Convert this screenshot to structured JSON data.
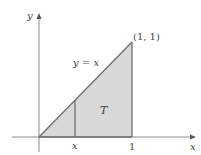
{
  "diagram": {
    "type": "region-plot",
    "colors": {
      "fill": "#d8d8d8",
      "outline": "#6e6e6e",
      "axis": "#8a8a8a",
      "text": "#444444"
    },
    "axes": {
      "x_label": "x",
      "y_label": "y"
    },
    "region": {
      "label": "T",
      "vertices": [
        [
          0,
          0
        ],
        [
          1,
          0
        ],
        [
          1,
          1
        ]
      ]
    },
    "curve_label": "y = x",
    "vertex_label": "(1, 1)",
    "tick_labels": {
      "strip_x": "x",
      "one": "1"
    }
  }
}
